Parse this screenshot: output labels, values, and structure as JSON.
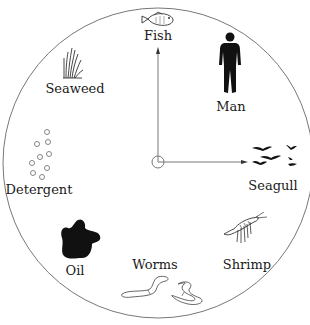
{
  "diagram": {
    "type": "circular-spinner",
    "colors": {
      "stroke": "#777777",
      "fill": "#111111",
      "background": "#ffffff"
    },
    "items": [
      {
        "label": "Fish",
        "icon": "fish-icon"
      },
      {
        "label": "Man",
        "icon": "man-icon"
      },
      {
        "label": "Seagull",
        "icon": "seagull-icon"
      },
      {
        "label": "Shrimp",
        "icon": "shrimp-icon"
      },
      {
        "label": "Worms",
        "icon": "worms-icon"
      },
      {
        "label": "Oil",
        "icon": "oil-icon"
      },
      {
        "label": "Detergent",
        "icon": "detergent-icon"
      },
      {
        "label": "Seaweed",
        "icon": "seaweed-icon"
      }
    ]
  }
}
